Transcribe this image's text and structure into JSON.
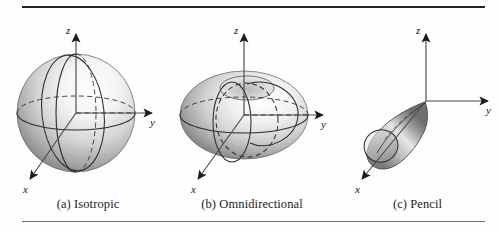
{
  "figure": {
    "type": "antenna-radiation-pattern-diagram",
    "background_color": "#fefefe",
    "ink_color": "#1c1c1c",
    "rule_top_color": "#242424",
    "rule_bottom_color": "#6f6f6f",
    "shade_light": "#fdfdfd",
    "shade_mid": "#b9b9b9",
    "shade_dark": "#6e6e6e"
  },
  "panels": [
    {
      "id": "a",
      "caption": "(a)  Isotropic",
      "shape": "sphere",
      "axes": {
        "z": "z",
        "y": "y",
        "x": "x"
      }
    },
    {
      "id": "b",
      "caption": "(b)  Omnidirectional",
      "shape": "oblate-toroid",
      "axes": {
        "z": "z",
        "y": "y",
        "x": "x"
      }
    },
    {
      "id": "c",
      "caption": "(c)  Pencil",
      "shape": "teardrop-lobe",
      "axes": {
        "z": "z",
        "y": "y",
        "x": "x"
      }
    }
  ]
}
